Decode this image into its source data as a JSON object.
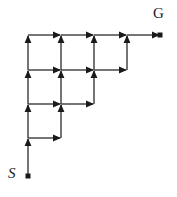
{
  "figure": {
    "width": 177,
    "height": 197,
    "background_color": "#ffffff",
    "line_color": "#3a3a3a",
    "arrow_color": "#1a1a1a",
    "marker_color": "#1a1a1a",
    "line_width": 1.4,
    "grid": {
      "cell_width": 33,
      "cell_height": 34,
      "x_positions": [
        28,
        61,
        94,
        127,
        160
      ],
      "y_positions": [
        35,
        70,
        104,
        138,
        176
      ],
      "columns": 5,
      "rows": 5
    }
  },
  "labels": {
    "start": {
      "text": "S",
      "x": 8,
      "y": 166,
      "style": "italic"
    },
    "goal": {
      "text": "G",
      "x": 153,
      "y": 6,
      "style": "upright"
    }
  },
  "markers": [
    {
      "name": "start-marker",
      "x": 28,
      "y": 176,
      "size": 5
    },
    {
      "name": "goal-marker",
      "x": 160,
      "y": 35,
      "size": 5
    }
  ],
  "edges": {
    "vertical": [
      {
        "x": 28,
        "y_from": 176,
        "y_to": 138,
        "arrow": true
      },
      {
        "x": 28,
        "y_from": 138,
        "y_to": 104,
        "arrow": true
      },
      {
        "x": 28,
        "y_from": 104,
        "y_to": 70,
        "arrow": true
      },
      {
        "x": 28,
        "y_from": 70,
        "y_to": 35,
        "arrow": true
      },
      {
        "x": 61,
        "y_from": 138,
        "y_to": 104,
        "arrow": true
      },
      {
        "x": 61,
        "y_from": 104,
        "y_to": 70,
        "arrow": true
      },
      {
        "x": 61,
        "y_from": 70,
        "y_to": 35,
        "arrow": true
      },
      {
        "x": 94,
        "y_from": 104,
        "y_to": 70,
        "arrow": true
      },
      {
        "x": 94,
        "y_from": 70,
        "y_to": 35,
        "arrow": true
      },
      {
        "x": 127,
        "y_from": 70,
        "y_to": 35,
        "arrow": true
      }
    ],
    "horizontal": [
      {
        "y": 35,
        "x_from": 28,
        "x_to": 61,
        "arrow": true
      },
      {
        "y": 35,
        "x_from": 61,
        "x_to": 94,
        "arrow": true
      },
      {
        "y": 35,
        "x_from": 94,
        "x_to": 127,
        "arrow": true
      },
      {
        "y": 35,
        "x_from": 127,
        "x_to": 160,
        "arrow": true
      },
      {
        "y": 70,
        "x_from": 28,
        "x_to": 61,
        "arrow": true
      },
      {
        "y": 70,
        "x_from": 61,
        "x_to": 94,
        "arrow": true
      },
      {
        "y": 70,
        "x_from": 94,
        "x_to": 127,
        "arrow": true
      },
      {
        "y": 104,
        "x_from": 28,
        "x_to": 61,
        "arrow": true
      },
      {
        "y": 104,
        "x_from": 61,
        "x_to": 94,
        "arrow": true
      },
      {
        "y": 138,
        "x_from": 28,
        "x_to": 61,
        "arrow": true
      }
    ]
  }
}
